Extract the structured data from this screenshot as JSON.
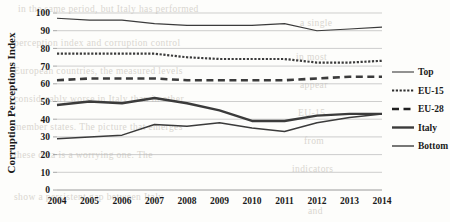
{
  "chart_data": {
    "type": "line",
    "title": "",
    "xlabel": "",
    "ylabel": "Corruption Perceptions Index",
    "ylim": [
      0,
      100
    ],
    "ytick_step": 10,
    "yticks": [
      "100",
      "90",
      "80",
      "70",
      "60",
      "50",
      "40",
      "30",
      "20",
      "10",
      "0"
    ],
    "grid": true,
    "legend_position": "right",
    "categories": [
      "2004",
      "2005",
      "2006",
      "2007",
      "2008",
      "2009",
      "2010",
      "2011",
      "2012",
      "2013",
      "2014"
    ],
    "x": [
      2004,
      2005,
      2006,
      2007,
      2008,
      2009,
      2010,
      2011,
      2012,
      2013,
      2014
    ],
    "series": [
      {
        "name": "Top",
        "style": "solid-thin",
        "color": "#3b3b3b",
        "values": [
          97,
          96,
          96,
          94,
          93,
          93,
          93,
          94,
          90,
          91,
          92
        ]
      },
      {
        "name": "EU-15",
        "style": "dotted",
        "color": "#2e2e2e",
        "values": [
          77,
          77,
          77,
          77,
          75,
          74,
          74,
          74,
          72,
          72,
          73
        ]
      },
      {
        "name": "EU-28",
        "style": "dashed",
        "color": "#202020",
        "values": [
          62,
          63,
          63,
          63,
          62,
          62,
          62,
          62,
          63,
          64,
          64
        ]
      },
      {
        "name": "Italy",
        "style": "solid-thick",
        "color": "#3b3b3b",
        "values": [
          48,
          50,
          49,
          52,
          49,
          45,
          39,
          39,
          42,
          43,
          43
        ]
      },
      {
        "name": "Bottom",
        "style": "solid-medium",
        "color": "#4a4a4a",
        "values": [
          29,
          30,
          31,
          37,
          36,
          38,
          35,
          33,
          38,
          41,
          43
        ]
      }
    ]
  },
  "legend": {
    "entries": [
      {
        "label": "Top"
      },
      {
        "label": "EU-15"
      },
      {
        "label": "EU-28"
      },
      {
        "label": "Italy"
      },
      {
        "label": "Bottom"
      }
    ]
  },
  "page_background": {
    "bleed_lines": [
      {
        "text": "in the same period, but Italy has performed",
        "x": 18,
        "y": 4
      },
      {
        "text": "a single",
        "x": 300,
        "y": 18
      },
      {
        "text": "perception index and corruption control",
        "x": 14,
        "y": 38
      },
      {
        "text": "in most",
        "x": 296,
        "y": 52
      },
      {
        "text": "European countries, the measured levels",
        "x": 14,
        "y": 66
      },
      {
        "text": "appear",
        "x": 300,
        "y": 80
      },
      {
        "text": "considerably worse in Italy than in other",
        "x": 14,
        "y": 94
      },
      {
        "text": "EU-15",
        "x": 298,
        "y": 108
      },
      {
        "text": "member states. The picture that emerges",
        "x": 14,
        "y": 122
      },
      {
        "text": "from",
        "x": 304,
        "y": 136
      },
      {
        "text": "these data is a worrying one. The",
        "x": 14,
        "y": 150
      },
      {
        "text": "indicators",
        "x": 292,
        "y": 164
      },
      {
        "text": "show a persistent gap between Italy",
        "x": 14,
        "y": 192
      },
      {
        "text": "and",
        "x": 308,
        "y": 206
      }
    ]
  }
}
